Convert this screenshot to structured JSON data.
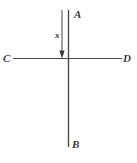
{
  "figure": {
    "kind": "geometry-line-diagram",
    "width": 137,
    "height": 163,
    "background_color": "#ffffff",
    "stroke_color": "#4a4a4a",
    "label_color": "#3b3b3b"
  },
  "labels": {
    "top_endpoint": "A",
    "bottom_endpoint": "B",
    "left_endpoint": "C",
    "right_endpoint": "D",
    "arrow_measure": "x"
  },
  "geometry": {
    "vertical_line": {
      "name": "AB",
      "x": 68.5,
      "y_top": 10,
      "y_bottom": 147
    },
    "horizontal_line": {
      "name": "CD",
      "y": 58.5,
      "x_left": 13,
      "x_right": 122
    },
    "intersection": {
      "x": 68.5,
      "y": 58.5
    },
    "arrow": {
      "x": 62,
      "y_start": 10,
      "y_end": 58,
      "direction": "down",
      "head_width": 5,
      "head_height": 7
    }
  }
}
